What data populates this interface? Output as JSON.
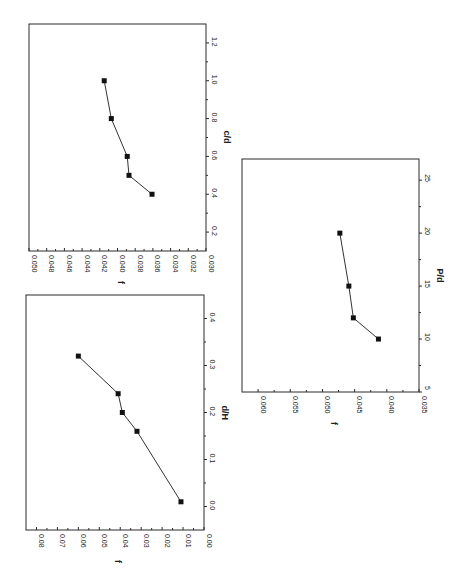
{
  "chart_data": [
    {
      "id": "chart-cd",
      "type": "line",
      "orientation": "rotated-90-ccw",
      "title": "",
      "xlabel": "c/d",
      "ylabel": "f",
      "x": [
        0.4,
        0.5,
        0.6,
        0.8,
        1.0
      ],
      "series": [
        {
          "name": "f",
          "values": [
            0.0361,
            0.0387,
            0.0389,
            0.0407,
            0.0415
          ],
          "marker": "square"
        }
      ],
      "xlim": [
        0.1,
        1.3
      ],
      "ylim": [
        0.03,
        0.05
      ],
      "xticks": [
        "0.2",
        "0.4",
        "0.6",
        "0.8",
        "1.0",
        "1.2"
      ],
      "yticks": [
        "0.050",
        "0.048",
        "0.046",
        "0.044",
        "0.042",
        "0.040",
        "0.038",
        "0.036",
        "0.034",
        "0.032",
        "0.030"
      ],
      "grid": false,
      "legend": false,
      "frame": {
        "left": 29,
        "top": 24,
        "right": 206,
        "bottom": 251
      }
    },
    {
      "id": "chart-dh",
      "type": "line",
      "orientation": "rotated-90-ccw",
      "title": "",
      "xlabel": "d/H",
      "ylabel": "f",
      "x": [
        0.01,
        0.16,
        0.2,
        0.24,
        0.32
      ],
      "series": [
        {
          "name": "f",
          "values": [
            0.011,
            0.032,
            0.039,
            0.041,
            0.06
          ],
          "marker": "square"
        }
      ],
      "xlim": [
        -0.05,
        0.45
      ],
      "ylim": [
        0.0,
        0.085
      ],
      "xticks": [
        "0.0",
        "0.1",
        "0.2",
        "0.3",
        "0.4"
      ],
      "yticks": [
        "0.08",
        "0.07",
        "0.06",
        "0.05",
        "0.04",
        "0.03",
        "0.02",
        "0.01",
        "0.00"
      ],
      "grid": false,
      "legend": false,
      "frame": {
        "left": 26,
        "top": 295,
        "right": 204,
        "bottom": 530
      }
    },
    {
      "id": "chart-pd",
      "type": "line",
      "orientation": "rotated-90-ccw",
      "title": "",
      "xlabel": "P/d",
      "ylabel": "f",
      "x": [
        10,
        12,
        15,
        20
      ],
      "series": [
        {
          "name": "f",
          "values": [
            0.0413,
            0.0452,
            0.0459,
            0.0473
          ],
          "marker": "square"
        }
      ],
      "xlim": [
        5,
        27
      ],
      "ylim": [
        0.035,
        0.0625
      ],
      "xticks": [
        "5",
        "10",
        "15",
        "20",
        "25"
      ],
      "yticks": [
        "0.060",
        "0.055",
        "0.050",
        "0.045",
        "0.040",
        "0.035"
      ],
      "grid": false,
      "legend": false,
      "frame": {
        "left": 242,
        "top": 159,
        "right": 419,
        "bottom": 392
      }
    }
  ]
}
